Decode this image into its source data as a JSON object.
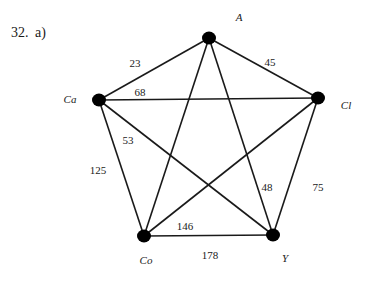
{
  "problem": {
    "number": "32.",
    "part": "a)"
  },
  "graph": {
    "type": "complete weighted graph",
    "nodes": [
      {
        "id": "A",
        "label": "A",
        "x": 209,
        "y": 38,
        "label_x": 239,
        "label_y": 21
      },
      {
        "id": "Ca",
        "label": "Ca",
        "x": 99,
        "y": 100,
        "label_x": 70,
        "label_y": 103
      },
      {
        "id": "Cl",
        "label": "Cl",
        "x": 318,
        "y": 98,
        "label_x": 346,
        "label_y": 109
      },
      {
        "id": "Co",
        "label": "Co",
        "x": 144,
        "y": 236,
        "label_x": 146,
        "label_y": 264
      },
      {
        "id": "Y",
        "label": "Y",
        "x": 273,
        "y": 235,
        "label_x": 285,
        "label_y": 262
      }
    ],
    "edges": [
      {
        "from": "A",
        "to": "Ca",
        "weight": "23",
        "label_x": 135,
        "label_y": 67
      },
      {
        "from": "A",
        "to": "Cl",
        "weight": "45",
        "label_x": 270,
        "label_y": 66
      },
      {
        "from": "Ca",
        "to": "Cl",
        "weight": "68",
        "label_x": 140,
        "label_y": 96
      },
      {
        "from": "Ca",
        "to": "Y",
        "weight": "53",
        "label_x": 128,
        "label_y": 144
      },
      {
        "from": "Ca",
        "to": "Co",
        "weight": "125",
        "label_x": 98,
        "label_y": 174
      },
      {
        "from": "A",
        "to": "Y",
        "weight": "48",
        "label_x": 267,
        "label_y": 191
      },
      {
        "from": "Cl",
        "to": "Y",
        "weight": "75",
        "label_x": 318,
        "label_y": 191
      },
      {
        "from": "Cl",
        "to": "Co",
        "weight": "146",
        "label_x": 185,
        "label_y": 230
      },
      {
        "from": "Co",
        "to": "Y",
        "weight": "178",
        "label_x": 210,
        "label_y": 259
      },
      {
        "from": "A",
        "to": "Co",
        "weight": "",
        "label_x": 0,
        "label_y": 0
      }
    ],
    "colors": {
      "edge": "#1a1a1a",
      "node": "#000000",
      "text": "#1a1a1a"
    }
  }
}
